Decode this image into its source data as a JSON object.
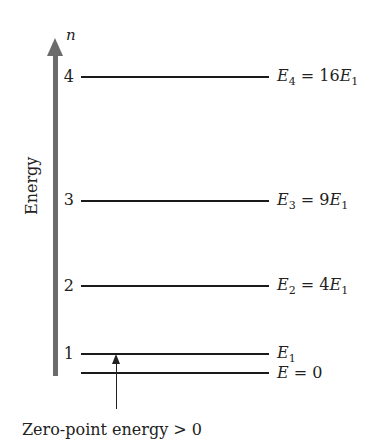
{
  "diagram": {
    "type": "energy-level-diagram",
    "axis": {
      "label": "Energy",
      "quantum_number_label": "n",
      "color": "#6b6b6b"
    },
    "levels": [
      {
        "n": "4",
        "symbol": "E",
        "sub": "4",
        "equals": " = 16",
        "rhs_symbol": "E",
        "rhs_sub": "1"
      },
      {
        "n": "3",
        "symbol": "E",
        "sub": "3",
        "equals": " = 9",
        "rhs_symbol": "E",
        "rhs_sub": "1"
      },
      {
        "n": "2",
        "symbol": "E",
        "sub": "2",
        "equals": " = 4",
        "rhs_symbol": "E",
        "rhs_sub": "1"
      },
      {
        "n": "1",
        "symbol": "E",
        "sub": "1",
        "equals": "",
        "rhs_symbol": "",
        "rhs_sub": ""
      }
    ],
    "zero_level": {
      "symbol": "E",
      "equals": " = 0"
    },
    "annotation": {
      "text": "Zero-point energy > 0"
    }
  }
}
